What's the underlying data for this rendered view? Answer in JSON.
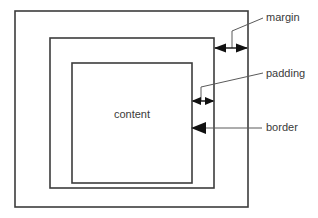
{
  "diagram": {
    "type": "box-model-diagram",
    "colors": {
      "background": "#ffffff",
      "box_stroke": "#3c3c3c",
      "leader_line": "#5a5a5a",
      "arrow_fill": "#111111",
      "text": "#3a3a3a"
    },
    "boxes": [
      {
        "id": "margin-box",
        "name": "margin box",
        "x": 15,
        "y": 11,
        "width": 233,
        "height": 196
      },
      {
        "id": "border-box",
        "name": "border box",
        "x": 50,
        "y": 38,
        "width": 164,
        "height": 150
      },
      {
        "id": "content-box",
        "name": "content box",
        "x": 72,
        "y": 63,
        "width": 120,
        "height": 120,
        "label": "content"
      }
    ],
    "content_label": "content",
    "callouts": [
      {
        "id": "margin-callout",
        "label": "margin",
        "label_x": 266,
        "label_y": 21,
        "arrow_type": "double",
        "arrow_y": 48,
        "arrow_from_x": 214,
        "arrow_to_x": 248,
        "leader_points": "263,18 232,31 232,48"
      },
      {
        "id": "padding-callout",
        "label": "padding",
        "label_x": 266,
        "label_y": 77,
        "arrow_type": "double",
        "arrow_y": 101,
        "arrow_from_x": 192,
        "arrow_to_x": 214,
        "leader_points": "263,73 201,87 201,101"
      },
      {
        "id": "border-callout",
        "label": "border",
        "label_x": 266,
        "label_y": 131,
        "arrow_type": "single-left",
        "arrow_y": 128,
        "arrow_from_x": 262,
        "arrow_to_x": 192,
        "leader_points": "262,128 200,128"
      }
    ]
  }
}
